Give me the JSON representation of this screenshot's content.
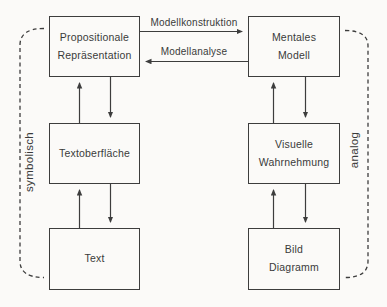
{
  "diagram": {
    "boxes": {
      "propositional": "Propositionale\nRepräsentation",
      "mental_model": "Mentales\nModell",
      "text_surface": "Textoberfläche",
      "visual_perception": "Visuelle\nWahrnehmung",
      "text": "Text",
      "picture_diagram": "Bild\nDiagramm"
    },
    "arrow_labels": {
      "model_construction": "Modellkonstruktion",
      "model_analysis": "Modellanalyse"
    },
    "side_labels": {
      "left": "symbolisch",
      "right": "analog"
    },
    "colors": {
      "line": "#3d3d3d",
      "text": "#3a3a3a",
      "background": "#fbfaf8"
    }
  }
}
